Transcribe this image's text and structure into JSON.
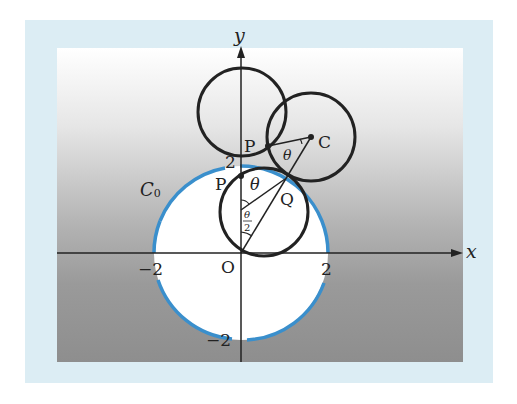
{
  "diagram": {
    "axes": {
      "x_label": "x",
      "y_label": "y",
      "origin_label": "O",
      "ticks": {
        "x_neg": "−2",
        "x_pos": "2",
        "y_pos": "2",
        "y_neg": "−2"
      }
    },
    "curve_label": "C",
    "curve_label_sub": "0",
    "points": {
      "P_lower": "P",
      "P_upper": "P",
      "C": "C",
      "Q": "Q"
    },
    "angles": {
      "theta_lower": "θ",
      "theta_upper": "θ",
      "half_theta_num": "θ",
      "half_theta_den": "2"
    },
    "colors": {
      "frame": "#dcedf4",
      "c0_stroke": "#3a8fcc",
      "circle_stroke": "#222222"
    }
  }
}
